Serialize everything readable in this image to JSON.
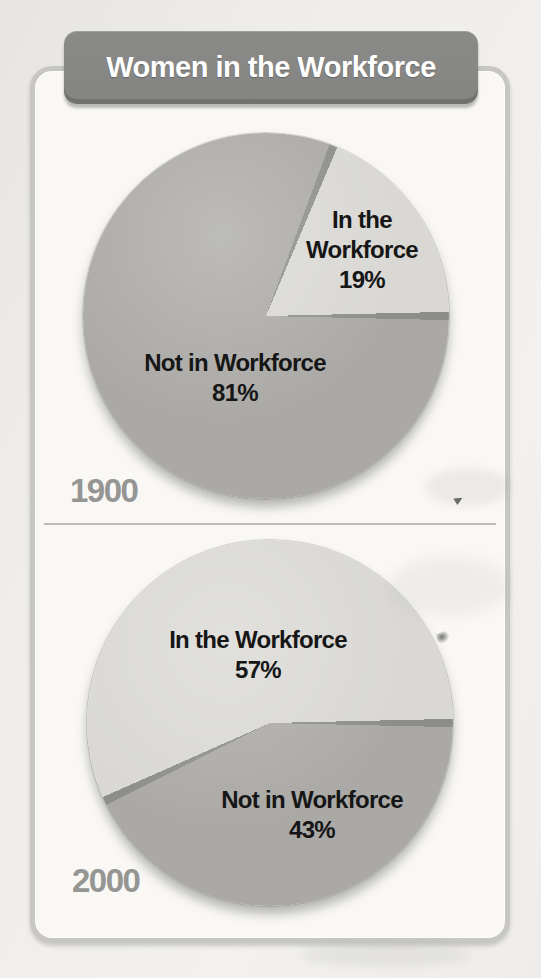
{
  "title": "Women in the Workforce",
  "palette": {
    "page_bg": "#efeeec",
    "panel_bg": "#f9f8f5",
    "panel_border": "#c7c6c4",
    "title_bg": "#8a8a88",
    "title_text": "#ffffff",
    "divider": "#bcbbb8",
    "year_text": "#959593",
    "label_text": "#161616",
    "slice_dark": "#aaa9a6",
    "slice_light": "#d9d8d4",
    "slice_stroke": "#8d8d8b"
  },
  "chart_data": [
    {
      "type": "pie",
      "year": "1900",
      "start_angle": "east",
      "direction": "clockwise",
      "legend_position": "labels-on-slices",
      "slices": [
        {
          "label": "Not in Workforce",
          "value": 81,
          "pct_label": "81%",
          "color": "#aaa9a6"
        },
        {
          "label": "In the Workforce",
          "value": 19,
          "pct_label": "19%",
          "color": "#d9d8d4"
        }
      ]
    },
    {
      "type": "pie",
      "year": "2000",
      "start_angle": "east",
      "direction": "clockwise",
      "legend_position": "labels-on-slices",
      "slices": [
        {
          "label": "Not in Workforce",
          "value": 43,
          "pct_label": "43%",
          "color": "#aaa9a6"
        },
        {
          "label": "In the Workforce",
          "value": 57,
          "pct_label": "57%",
          "color": "#d9d8d4"
        }
      ]
    }
  ]
}
